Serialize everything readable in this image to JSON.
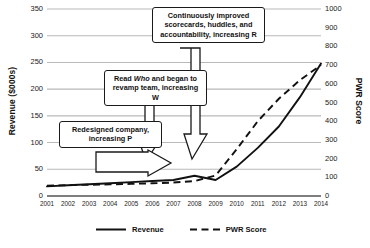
{
  "chart_data": {
    "type": "line",
    "title": "",
    "xlabel": "",
    "ylabel": "Revenue ($000s)",
    "y2label": "PWR Score",
    "grid": true,
    "legend_position": "bottom",
    "categories": [
      "2001",
      "2002",
      "2003",
      "2004",
      "2005",
      "2006",
      "2007",
      "2008",
      "2009",
      "2010",
      "2011",
      "2012",
      "2013",
      "2014"
    ],
    "ylim": [
      0,
      350
    ],
    "yticks": [
      0,
      50,
      100,
      150,
      200,
      250,
      300,
      350
    ],
    "y2lim": [
      0,
      1000
    ],
    "y2ticks": [
      0,
      100,
      200,
      300,
      400,
      500,
      600,
      700,
      800,
      900,
      1000
    ],
    "series": [
      {
        "name": "Revenue",
        "axis": "left",
        "style": "solid",
        "color": "#111111",
        "values": [
          18,
          20,
          22,
          24,
          26,
          28,
          30,
          38,
          30,
          55,
          90,
          130,
          185,
          248
        ]
      },
      {
        "name": "PWR Score",
        "axis": "right",
        "style": "dashed",
        "color": "#111111",
        "values": [
          55,
          58,
          60,
          62,
          65,
          68,
          72,
          80,
          110,
          250,
          400,
          520,
          620,
          700
        ]
      }
    ],
    "annotations": [
      {
        "id": "callout-r",
        "text": "Continuously improved scorecards, huddles, and accountability, increasing R",
        "points_to": "2009"
      },
      {
        "id": "callout-w",
        "text_before": "Read ",
        "text_italic": "Who",
        "text_after": " and began to revamp team, increasing W",
        "points_to": "2009"
      },
      {
        "id": "callout-p",
        "text": "Redesigned company, increasing P",
        "points_to": "2009"
      }
    ]
  },
  "legend": {
    "items": [
      {
        "label": "Revenue",
        "style": "solid"
      },
      {
        "label": "PWR Score",
        "style": "dashed"
      }
    ]
  },
  "footer": {
    "caption": ""
  }
}
